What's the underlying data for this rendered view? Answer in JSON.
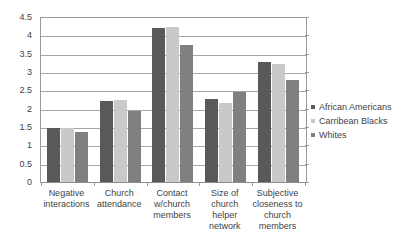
{
  "chart_data": {
    "type": "bar",
    "title": "",
    "subtitle": "",
    "xlabel": "",
    "ylabel": "",
    "ylim": [
      0,
      4.5
    ],
    "ytick_interval": 0.5,
    "yticks": [
      "0",
      "0.5",
      "1",
      "1.5",
      "2",
      "2.5",
      "3",
      "3.5",
      "4",
      "4.5"
    ],
    "grid": true,
    "legend_position": "right",
    "categories": [
      "Negative interactions",
      "Church attendance",
      "Contact w/church members",
      "Size of church helper network",
      "Subjective closeness to church members"
    ],
    "category_lines": [
      [
        "Negative",
        "interactions"
      ],
      [
        "Church",
        "attendance"
      ],
      [
        "Contact",
        "w/church",
        "members"
      ],
      [
        "Size of church",
        "helper",
        "network"
      ],
      [
        "Subjective",
        "closeness to",
        "church",
        "members"
      ]
    ],
    "series": [
      {
        "name": "African Americans",
        "color": "#595959",
        "values": [
          1.47,
          2.21,
          4.2,
          2.27,
          3.27
        ]
      },
      {
        "name": "Carribean Blacks",
        "color": "#c9c9c9",
        "values": [
          1.48,
          2.25,
          4.22,
          2.15,
          3.23
        ]
      },
      {
        "name": "Whites",
        "color": "#808080",
        "values": [
          1.37,
          1.94,
          3.75,
          2.45,
          2.78
        ]
      }
    ]
  }
}
